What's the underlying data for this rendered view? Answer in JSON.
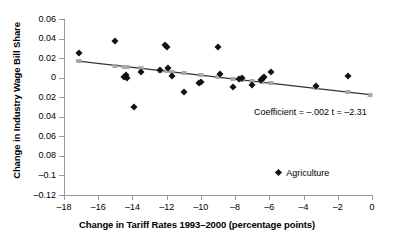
{
  "chart_data": {
    "type": "scatter",
    "title": "",
    "xlabel": "Change in Tariff Rates 1993–2000 (percentage points)",
    "ylabel": "Change in Industry Wage Bill Share",
    "xlim": [
      -18,
      0
    ],
    "ylim": [
      -0.12,
      0.06
    ],
    "grid": false,
    "legend_position": "inside-bottom-right",
    "xticks": [
      -18,
      -16,
      -14,
      -12,
      -10,
      -8,
      -6,
      -4,
      -2,
      0
    ],
    "xtick_labels": [
      "–18",
      "–16",
      "–14",
      "–12",
      "–10",
      "–8",
      "–6",
      "–4",
      "–2",
      "0"
    ],
    "yticks": [
      0.06,
      0.04,
      0.02,
      0,
      -0.02,
      -0.04,
      -0.06,
      -0.08,
      -0.1,
      -0.12
    ],
    "ytick_labels": [
      "0.06",
      "0.04",
      "0.02",
      "0",
      "0.02",
      "0.04",
      "0.06",
      "0.08",
      "–0.1",
      "–0.12"
    ],
    "annotations": [
      {
        "text": "Coefficient = –.002 t = –2.31",
        "x": -6.9,
        "y": -0.036
      }
    ],
    "series": [
      {
        "name": "Agriculture",
        "marker": "diamond",
        "color": "#111111",
        "points": [
          {
            "x": -17.1,
            "y": 0.0252
          },
          {
            "x": -15.0,
            "y": 0.0372
          },
          {
            "x": -14.5,
            "y": 0.0002
          },
          {
            "x": -14.4,
            "y": 0.0032
          },
          {
            "x": -14.3,
            "y": -0.0008
          },
          {
            "x": -13.9,
            "y": -0.03
          },
          {
            "x": -13.5,
            "y": 0.0062
          },
          {
            "x": -12.4,
            "y": 0.008
          },
          {
            "x": -12.1,
            "y": 0.0332
          },
          {
            "x": -12.0,
            "y": 0.031
          },
          {
            "x": -11.9,
            "y": 0.01
          },
          {
            "x": -11.7,
            "y": 0.0022
          },
          {
            "x": -11.0,
            "y": -0.0148
          },
          {
            "x": -10.1,
            "y": -0.005
          },
          {
            "x": -10.0,
            "y": -0.004
          },
          {
            "x": -9.0,
            "y": 0.0318
          },
          {
            "x": -8.9,
            "y": 0.0042
          },
          {
            "x": -8.1,
            "y": -0.0092
          },
          {
            "x": -7.8,
            "y": -0.0012
          },
          {
            "x": -7.6,
            "y": -0.0002
          },
          {
            "x": -7.0,
            "y": -0.0078
          },
          {
            "x": -6.5,
            "y": -0.0026
          },
          {
            "x": -6.4,
            "y": -0.0012
          },
          {
            "x": -6.35,
            "y": -0.0002
          },
          {
            "x": -6.3,
            "y": 0.001
          },
          {
            "x": -5.9,
            "y": 0.0062
          },
          {
            "x": -3.3,
            "y": -0.0082
          },
          {
            "x": -1.4,
            "y": 0.0018
          }
        ]
      },
      {
        "name": "Fitted values",
        "marker": "square",
        "color": "#a8a8a8",
        "points": [
          {
            "x": -17.1,
            "y": 0.0168
          },
          {
            "x": -15.0,
            "y": 0.0124
          },
          {
            "x": -14.5,
            "y": 0.0114
          },
          {
            "x": -14.3,
            "y": 0.011
          },
          {
            "x": -13.5,
            "y": 0.0094
          },
          {
            "x": -12.4,
            "y": 0.0072
          },
          {
            "x": -12.0,
            "y": 0.0064
          },
          {
            "x": -11.7,
            "y": 0.0058
          },
          {
            "x": -11.0,
            "y": 0.0044
          },
          {
            "x": -10.0,
            "y": 0.0024
          },
          {
            "x": -9.0,
            "y": 0.0004
          },
          {
            "x": -8.1,
            "y": -0.0014
          },
          {
            "x": -7.6,
            "y": -0.0024
          },
          {
            "x": -7.0,
            "y": -0.0036
          },
          {
            "x": -6.4,
            "y": -0.0048
          },
          {
            "x": -5.9,
            "y": -0.0058
          },
          {
            "x": -3.3,
            "y": -0.011
          },
          {
            "x": -1.4,
            "y": -0.0148
          },
          {
            "x": -0.1,
            "y": -0.0174
          }
        ]
      }
    ],
    "trendline": {
      "x0": -17.3,
      "y0": 0.0172,
      "x1": 0.0,
      "y1": -0.0176,
      "color": "#333333"
    }
  },
  "legend": {
    "entries": [
      {
        "label": "Agriculture",
        "marker": "diamond",
        "color": "#111111"
      }
    ]
  }
}
